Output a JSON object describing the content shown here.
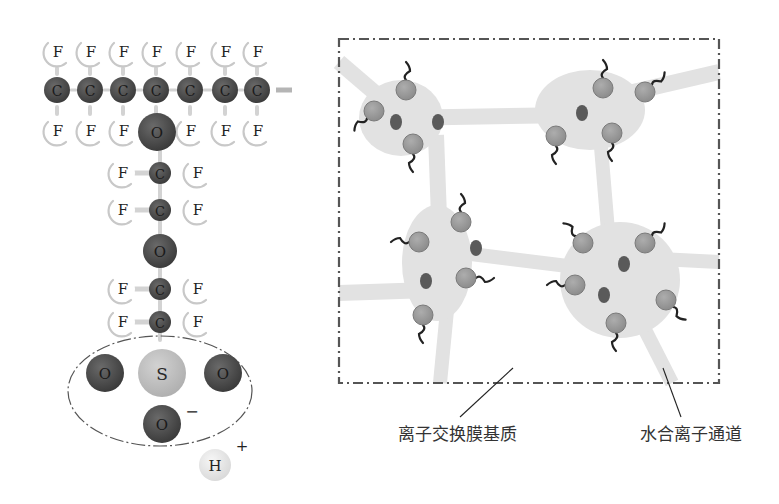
{
  "colors": {
    "background": "#ffffff",
    "carbon": "#4a4a4a",
    "oxygen": "#4a4a4a",
    "sulfur": "#bdbdbd",
    "fluorine_fill": "#ffffff",
    "fluorine_rim": "#c8c8c8",
    "hydrogen": "#e6e6e6",
    "bond": "#c9c9c9",
    "ellipse_stroke": "#555555",
    "cluster_fill": "#e2e2e2",
    "ion_fill": "#9a9a9a",
    "ion_stroke": "#7a7a7a",
    "small_ion_fill": "#5a5a5a",
    "tail": "#222222",
    "box_stroke": "#555555",
    "label_text": "#333333"
  },
  "molecule": {
    "title": "perfluorosulfonic acid side chain",
    "fluorine_top": [
      {
        "x": 57,
        "y": 52,
        "label": "F"
      },
      {
        "x": 90,
        "y": 52,
        "label": "F"
      },
      {
        "x": 123,
        "y": 52,
        "label": "F"
      },
      {
        "x": 156,
        "y": 52,
        "label": "F"
      },
      {
        "x": 190,
        "y": 52,
        "label": "F"
      },
      {
        "x": 225,
        "y": 52,
        "label": "F"
      },
      {
        "x": 257,
        "y": 52,
        "label": "F"
      }
    ],
    "carbon_backbone": [
      {
        "x": 57,
        "y": 90,
        "label": "C"
      },
      {
        "x": 90,
        "y": 90,
        "label": "C"
      },
      {
        "x": 123,
        "y": 90,
        "label": "C"
      },
      {
        "x": 156,
        "y": 90,
        "label": "C"
      },
      {
        "x": 190,
        "y": 90,
        "label": "C"
      },
      {
        "x": 225,
        "y": 90,
        "label": "C"
      },
      {
        "x": 257,
        "y": 90,
        "label": "C"
      }
    ],
    "backbone_stub": {
      "x1": 276,
      "y1": 90,
      "x2": 292,
      "y2": 90
    },
    "fluorine_bottom": [
      {
        "x": 57,
        "y": 131,
        "label": "F"
      },
      {
        "x": 90,
        "y": 131,
        "label": "F"
      },
      {
        "x": 123,
        "y": 131,
        "label": "F"
      },
      {
        "x": 190,
        "y": 131,
        "label": "F"
      },
      {
        "x": 225,
        "y": 131,
        "label": "F"
      },
      {
        "x": 257,
        "y": 131,
        "label": "F"
      }
    ],
    "ether_oxygens": [
      {
        "x": 157,
        "y": 132,
        "r": 19,
        "label": "O"
      },
      {
        "x": 160,
        "y": 251,
        "r": 17,
        "label": "O"
      }
    ],
    "side_chain_units": [
      {
        "y": 173,
        "c_x": 160,
        "f_left_x": 122,
        "f_right_x": 197,
        "c_label": "C",
        "f_label": "F"
      },
      {
        "y": 210,
        "c_x": 160,
        "f_left_x": 122,
        "f_right_x": 197,
        "c_label": "C",
        "f_label": "F"
      },
      {
        "y": 289,
        "c_x": 160,
        "f_left_x": 122,
        "f_right_x": 197,
        "c_label": "C",
        "f_label": "F"
      },
      {
        "y": 322,
        "c_x": 160,
        "f_left_x": 122,
        "f_right_x": 197,
        "c_label": "C",
        "f_label": "F"
      }
    ],
    "sulfonate_group": {
      "ellipse": {
        "cx": 160,
        "cy": 391,
        "rx": 92,
        "ry": 55
      },
      "sulfur": {
        "x": 162,
        "y": 373,
        "r": 24,
        "label": "S"
      },
      "oxygens": [
        {
          "x": 105,
          "y": 373,
          "r": 19,
          "label": "O"
        },
        {
          "x": 223,
          "y": 373,
          "r": 19,
          "label": "O"
        },
        {
          "x": 162,
          "y": 424,
          "r": 19,
          "label": "O"
        }
      ],
      "charge": {
        "x": 192,
        "y": 411,
        "label": "−"
      }
    },
    "proton": {
      "x": 215,
      "y": 465,
      "r": 16,
      "label": "H",
      "charge": {
        "x": 242,
        "y": 446,
        "label": "+"
      }
    }
  },
  "membrane": {
    "box": {
      "x": 339,
      "y": 39,
      "width": 380,
      "height": 344
    },
    "channels": [
      {
        "x1": 339,
        "y1": 62,
        "x2": 395,
        "y2": 110,
        "w": 16
      },
      {
        "x1": 395,
        "y1": 118,
        "x2": 575,
        "y2": 115,
        "w": 16
      },
      {
        "x1": 436,
        "y1": 135,
        "x2": 440,
        "y2": 245,
        "w": 16
      },
      {
        "x1": 600,
        "y1": 135,
        "x2": 610,
        "y2": 255,
        "w": 14
      },
      {
        "x1": 620,
        "y1": 95,
        "x2": 719,
        "y2": 72,
        "w": 16
      },
      {
        "x1": 339,
        "y1": 293,
        "x2": 430,
        "y2": 290,
        "w": 16
      },
      {
        "x1": 455,
        "y1": 252,
        "x2": 600,
        "y2": 270,
        "w": 14
      },
      {
        "x1": 448,
        "y1": 300,
        "x2": 440,
        "y2": 383,
        "w": 14
      },
      {
        "x1": 640,
        "y1": 258,
        "x2": 719,
        "y2": 262,
        "w": 14
      },
      {
        "x1": 640,
        "y1": 320,
        "x2": 672,
        "y2": 383,
        "w": 14
      }
    ],
    "clusters": [
      {
        "cx": 401,
        "cy": 118,
        "rx": 42,
        "ry": 38,
        "ions": [
          {
            "x": 406,
            "y": 90,
            "r": 10,
            "tail": "up"
          },
          {
            "x": 374,
            "y": 111,
            "r": 10,
            "tail": "down-left"
          },
          {
            "x": 413,
            "y": 144,
            "r": 10,
            "tail": "down"
          }
        ],
        "small_ions": [
          {
            "x": 396,
            "y": 122
          },
          {
            "x": 438,
            "y": 122
          }
        ]
      },
      {
        "cx": 590,
        "cy": 110,
        "rx": 55,
        "ry": 40,
        "ions": [
          {
            "x": 603,
            "y": 88,
            "r": 10,
            "tail": "up"
          },
          {
            "x": 645,
            "y": 92,
            "r": 10,
            "tail": "up-right"
          },
          {
            "x": 556,
            "y": 136,
            "r": 10,
            "tail": "down"
          },
          {
            "x": 612,
            "y": 133,
            "r": 10,
            "tail": "down"
          }
        ],
        "small_ions": [
          {
            "x": 582,
            "y": 113
          }
        ]
      },
      {
        "cx": 437,
        "cy": 263,
        "rx": 35,
        "ry": 58,
        "ions": [
          {
            "x": 461,
            "y": 222,
            "r": 10,
            "tail": "up"
          },
          {
            "x": 419,
            "y": 242,
            "r": 10,
            "tail": "left"
          },
          {
            "x": 466,
            "y": 278,
            "r": 10,
            "tail": "right"
          },
          {
            "x": 423,
            "y": 315,
            "r": 10,
            "tail": "down"
          }
        ],
        "small_ions": [
          {
            "x": 476,
            "y": 248
          },
          {
            "x": 426,
            "y": 281
          }
        ]
      },
      {
        "cx": 620,
        "cy": 280,
        "rx": 60,
        "ry": 58,
        "ions": [
          {
            "x": 583,
            "y": 243,
            "r": 10,
            "tail": "up-left"
          },
          {
            "x": 645,
            "y": 243,
            "r": 10,
            "tail": "up-right"
          },
          {
            "x": 575,
            "y": 285,
            "r": 10,
            "tail": "left"
          },
          {
            "x": 666,
            "y": 300,
            "r": 10,
            "tail": "down-right"
          },
          {
            "x": 616,
            "y": 323,
            "r": 10,
            "tail": "down"
          }
        ],
        "small_ions": [
          {
            "x": 624,
            "y": 264
          },
          {
            "x": 604,
            "y": 295
          }
        ]
      }
    ]
  },
  "callouts": [
    {
      "text": "离子交换膜基质",
      "name": "matrix-label",
      "x": 457,
      "y": 434,
      "line": {
        "x1": 513,
        "y1": 368,
        "x2": 460,
        "y2": 417
      }
    },
    {
      "text": "水合离子通道",
      "name": "channel-label",
      "x": 691,
      "y": 434,
      "line": {
        "x1": 663,
        "y1": 368,
        "x2": 681,
        "y2": 417
      }
    }
  ]
}
